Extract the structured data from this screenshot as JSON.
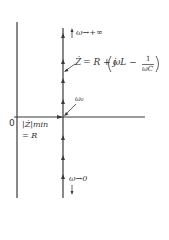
{
  "diagram": {
    "colors": {
      "line": "#3a3a3a",
      "text": "#333333",
      "background": "#ffffff"
    },
    "origin_label": "0",
    "top_label": "ω→+∞",
    "impedance_formula": {
      "lhs": "Ż",
      "rhs_prefix": "= R + j",
      "term": "ωL −",
      "frac_num": "1",
      "frac_den": "ωC"
    },
    "resonance_label": "ω₀",
    "min_label_line1": "|Ż|min",
    "min_label_line2": "= R",
    "bottom_label": "ω→0"
  }
}
